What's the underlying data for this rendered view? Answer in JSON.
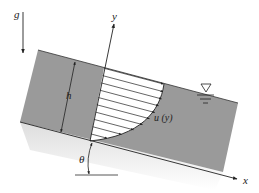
{
  "figure": {
    "labels": {
      "gravity": "g",
      "y_axis": "y",
      "x_axis": "x",
      "depth": "h",
      "velocity_profile": "u (y)",
      "angle": "θ"
    },
    "symbols": {
      "free_surface": "free-surface-triangle"
    },
    "colors": {
      "fluid": "#9a9a9a",
      "lines": "#222222",
      "background": "#ffffff",
      "profile_fill": "#ffffff"
    },
    "profile_arrow_count": 10
  }
}
